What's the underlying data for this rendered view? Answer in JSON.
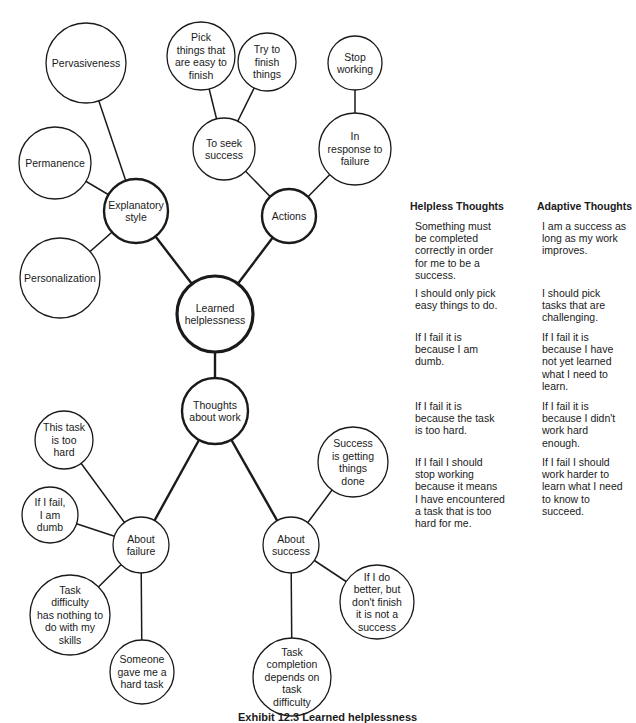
{
  "diagram": {
    "nodes": [
      {
        "id": "pervasiveness",
        "label": "Pervasiveness",
        "cx": 86,
        "cy": 63,
        "r": 40,
        "weight": 1
      },
      {
        "id": "permanence",
        "label": "Permanence",
        "cx": 55,
        "cy": 163,
        "r": 36,
        "weight": 1
      },
      {
        "id": "explanatory-style",
        "label": "Explanatory\nstyle",
        "cx": 136,
        "cy": 211,
        "r": 32,
        "weight": 2
      },
      {
        "id": "personalization",
        "label": "Personalization",
        "cx": 60,
        "cy": 278,
        "r": 40,
        "weight": 1
      },
      {
        "id": "pick-easy-things",
        "label": "Pick\nthings that\nare easy to\nfinish",
        "cx": 201,
        "cy": 56,
        "r": 34,
        "weight": 1
      },
      {
        "id": "try-to-finish",
        "label": "Try to\nfinish\nthings",
        "cx": 267,
        "cy": 62,
        "r": 29,
        "weight": 1
      },
      {
        "id": "to-seek-success",
        "label": "To seek\nsuccess",
        "cx": 224,
        "cy": 149,
        "r": 31,
        "weight": 1
      },
      {
        "id": "stop-working",
        "label": "Stop\nworking",
        "cx": 355,
        "cy": 63,
        "r": 27,
        "weight": 1
      },
      {
        "id": "in-response-to-failure",
        "label": "In\nresponse to\nfailure",
        "cx": 355,
        "cy": 149,
        "r": 36,
        "weight": 1
      },
      {
        "id": "actions",
        "label": "Actions",
        "cx": 289,
        "cy": 216,
        "r": 27,
        "weight": 2
      },
      {
        "id": "learned-helplessness",
        "label": "Learned\nhelplessness",
        "cx": 215,
        "cy": 314,
        "r": 38,
        "weight": 3
      },
      {
        "id": "thoughts-about-work",
        "label": "Thoughts\nabout work",
        "cx": 215,
        "cy": 411,
        "r": 33,
        "weight": 2
      },
      {
        "id": "this-task-too-hard",
        "label": "This task\nis too\nhard",
        "cx": 64,
        "cy": 440,
        "r": 29,
        "weight": 1
      },
      {
        "id": "if-i-fail-dumb",
        "label": "If I fail,\nI am\ndumb",
        "cx": 50,
        "cy": 515,
        "r": 28,
        "weight": 1
      },
      {
        "id": "about-failure",
        "label": "About\nfailure",
        "cx": 141,
        "cy": 545,
        "r": 28,
        "weight": 1
      },
      {
        "id": "task-difficulty-skills",
        "label": "Task\ndifficulty\nhas nothing to\ndo with my\nskills",
        "cx": 70,
        "cy": 615,
        "r": 40,
        "weight": 1
      },
      {
        "id": "someone-gave-hard-task",
        "label": "Someone\ngave me a\nhard task",
        "cx": 142,
        "cy": 672,
        "r": 32,
        "weight": 1
      },
      {
        "id": "success-getting-done",
        "label": "Success\nis getting\nthings\ndone",
        "cx": 353,
        "cy": 462,
        "r": 35,
        "weight": 1
      },
      {
        "id": "about-success",
        "label": "About\nsuccess",
        "cx": 291,
        "cy": 545,
        "r": 28,
        "weight": 1
      },
      {
        "id": "do-better-not-finish",
        "label": "If I do\nbetter, but\ndon't finish\nit is not a\nsuccess",
        "cx": 377,
        "cy": 602,
        "r": 37,
        "weight": 1
      },
      {
        "id": "task-completion-difficulty",
        "label": "Task\ncompletion\ndepends on\ntask\ndifficulty",
        "cx": 292,
        "cy": 677,
        "r": 39,
        "weight": 1
      }
    ],
    "edges": [
      {
        "from": "pervasiveness",
        "to": "explanatory-style",
        "weight": 1
      },
      {
        "from": "permanence",
        "to": "explanatory-style",
        "weight": 1
      },
      {
        "from": "personalization",
        "to": "explanatory-style",
        "weight": 1
      },
      {
        "from": "explanatory-style",
        "to": "learned-helplessness",
        "weight": 2
      },
      {
        "from": "pick-easy-things",
        "to": "to-seek-success",
        "weight": 1
      },
      {
        "from": "try-to-finish",
        "to": "to-seek-success",
        "weight": 1
      },
      {
        "from": "to-seek-success",
        "to": "actions",
        "weight": 1
      },
      {
        "from": "stop-working",
        "to": "in-response-to-failure",
        "weight": 1
      },
      {
        "from": "in-response-to-failure",
        "to": "actions",
        "weight": 1
      },
      {
        "from": "actions",
        "to": "learned-helplessness",
        "weight": 2
      },
      {
        "from": "learned-helplessness",
        "to": "thoughts-about-work",
        "weight": 2
      },
      {
        "from": "thoughts-about-work",
        "to": "about-failure",
        "weight": 2
      },
      {
        "from": "thoughts-about-work",
        "to": "about-success",
        "weight": 2
      },
      {
        "from": "this-task-too-hard",
        "to": "about-failure",
        "weight": 1
      },
      {
        "from": "if-i-fail-dumb",
        "to": "about-failure",
        "weight": 1
      },
      {
        "from": "task-difficulty-skills",
        "to": "about-failure",
        "weight": 1
      },
      {
        "from": "someone-gave-hard-task",
        "to": "about-failure",
        "weight": 1
      },
      {
        "from": "success-getting-done",
        "to": "about-success",
        "weight": 1
      },
      {
        "from": "do-better-not-finish",
        "to": "about-success",
        "weight": 1
      },
      {
        "from": "task-completion-difficulty",
        "to": "about-success",
        "weight": 1
      }
    ]
  },
  "thoughts_table": {
    "helpless_heading": "Helpless Thoughts",
    "adaptive_heading": "Adaptive Thoughts",
    "rows": [
      {
        "top": 220,
        "helpless": "Something must\nbe completed\ncorrectly in order\nfor me to be a\nsuccess.",
        "adaptive": "I am a success as\nlong as my work\nimproves."
      },
      {
        "top": 287,
        "helpless": "I should only pick\neasy things to do.",
        "adaptive": "I should pick\ntasks that are\nchallenging."
      },
      {
        "top": 331,
        "helpless": "If I fail it is\nbecause I am\ndumb.",
        "adaptive": "If I fail it is\nbecause I have\nnot yet learned\nwhat I need to\nlearn."
      },
      {
        "top": 400,
        "helpless": "If I fail it is\nbecause the task\nis too hard.",
        "adaptive": "If I fail it is\nbecause I didn't\nwork hard\nenough."
      },
      {
        "top": 456,
        "helpless": "If I fail I should\nstop working\nbecause it means\nI have encountered\na task that is too\nhard for me.",
        "adaptive": "If I fail I should\nwork harder to\nlearn what I need\nto know to\nsucceed."
      }
    ]
  },
  "caption": "Exhibit 12.3 Learned helplessness"
}
